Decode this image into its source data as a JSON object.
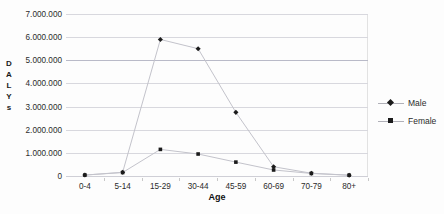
{
  "chart_data": {
    "type": "line",
    "title": "",
    "xlabel": "Age",
    "ylabel": "DALYs",
    "ylabel_letters": [
      "D",
      "A",
      "L",
      "Y",
      "s"
    ],
    "categories": [
      "0-4",
      "5-14",
      "15-29",
      "30-44",
      "45-59",
      "60-69",
      "70-79",
      "80+"
    ],
    "ylim": [
      0,
      7000000
    ],
    "ytick_values": [
      7000000,
      6000000,
      5000000,
      4000000,
      3000000,
      2000000,
      1000000,
      0
    ],
    "ytick_labels": [
      "7.000.000",
      "6.000.000",
      "5.000.000",
      "4.000.000",
      "3.000.000",
      "2.000.000",
      "1.000.000",
      "0"
    ],
    "grid": true,
    "legend_position": "right",
    "series": [
      {
        "name": "Male",
        "marker": "diamond",
        "color": "#1b1b1b",
        "line_color": "#c3c3cb",
        "values": [
          40000,
          160000,
          5900000,
          5500000,
          2750000,
          400000,
          120000,
          35000
        ]
      },
      {
        "name": "Female",
        "marker": "square",
        "color": "#1b1b1b",
        "line_color": "#c3c3cb",
        "values": [
          40000,
          150000,
          1150000,
          950000,
          600000,
          260000,
          110000,
          35000
        ]
      }
    ]
  },
  "legend": {
    "items": [
      {
        "label": "Male"
      },
      {
        "label": "Female"
      }
    ]
  },
  "colors": {
    "gridline": "#d8d8de",
    "gridline_strong": "#b9bac8",
    "marker": "#1b1b1b",
    "line": "#c3c3cb",
    "text": "#2b2b2b",
    "background": "#fdfdfd"
  }
}
